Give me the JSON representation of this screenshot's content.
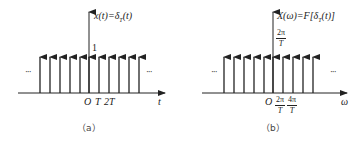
{
  "panels": [
    {
      "id": "a",
      "caption": "（a）",
      "title": {
        "lhs": "x(t)=δ",
        "sub": "T",
        "rhs": "(t)"
      },
      "height_label": "1",
      "x_axis_label": "t",
      "tick_labels": [
        "O",
        "T",
        "2T"
      ],
      "ellipsis": "···",
      "impulse_count": 11
    },
    {
      "id": "b",
      "caption": "（b）",
      "title": {
        "lhs": "X(ω)=F[δ",
        "sub": "T",
        "rhs": "(t)]"
      },
      "height_label": {
        "num": "2π",
        "den": "T"
      },
      "x_axis_label": "ω",
      "tick_labels": [
        "O",
        {
          "num": "2π",
          "den": "T"
        },
        {
          "num": "4π",
          "den": "T"
        }
      ],
      "ellipsis": "···",
      "impulse_count": 10
    }
  ],
  "colors": {
    "stroke": "#222222",
    "background": "#ffffff"
  }
}
